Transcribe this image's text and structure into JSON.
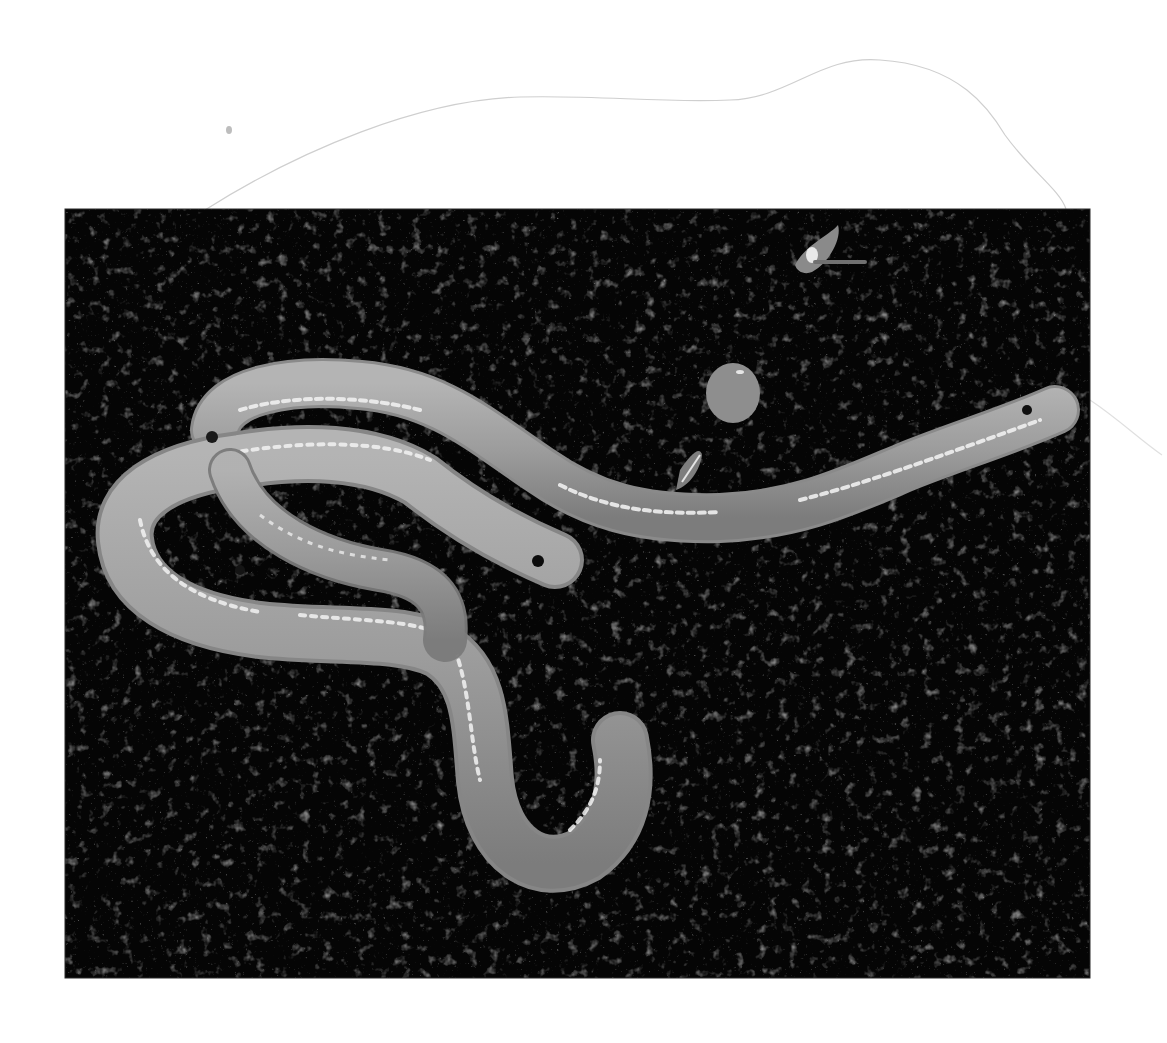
{
  "image": {
    "subject": "Two pale worms on dark soil",
    "style": "grayscale photograph",
    "background_color": "#ffffff",
    "photo": {
      "x": 65,
      "y": 209,
      "width": 1025,
      "height": 769,
      "soil_color": "#050505",
      "worm_color": "#9a9a9a",
      "highlight_color": "#f2f2f2"
    },
    "annotations": {
      "sketch_line_color": "#c8c8c8",
      "smudge_color": "#bdbdbd"
    }
  }
}
